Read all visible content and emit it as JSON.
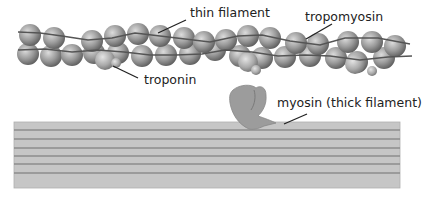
{
  "labels": {
    "thin_filament": "thin filament",
    "tropomyosin": "tropomyosin",
    "troponin": "troponin",
    "myosin": "myosin (thick filament)"
  },
  "colors": {
    "background": "#ffffff",
    "actin_light": "#d8d8d8",
    "actin_mid": "#9a9a9a",
    "actin_dark": "#5e5e5e",
    "tropomyosin_strand": "#555555",
    "thick_filament_fill": "#c4c4c4",
    "thick_filament_lines": "#8c8c8c",
    "myosin_head": "#9c9c9c",
    "leader_line": "#222222",
    "text": "#222222"
  },
  "diagram": {
    "thin_filament": {
      "top_row_beads_x": [
        38,
        62,
        88,
        113,
        138,
        163,
        188,
        213,
        238,
        262,
        288,
        313,
        338,
        363,
        388
      ],
      "top_row_y": [
        33,
        36,
        40,
        40,
        37,
        36,
        38,
        42,
        39,
        36,
        38,
        42,
        40,
        38,
        42
      ],
      "bottom_row_beads_x": [
        30,
        52,
        72,
        98,
        120,
        146,
        170,
        196,
        222,
        248,
        272,
        298,
        324,
        350,
        374,
        398
      ],
      "bottom_row_y": [
        52,
        55,
        55,
        53,
        50,
        53,
        55,
        55,
        50,
        52,
        55,
        55,
        53,
        58,
        60,
        57
      ],
      "troponin_positions": [
        [
          104,
          60
        ],
        [
          258,
          64
        ],
        [
          370,
          66
        ]
      ]
    },
    "thick_filament": {
      "x": 14,
      "y": 122,
      "width": 386,
      "height": 66,
      "line_y": [
        128,
        138,
        148,
        158,
        168,
        178
      ]
    }
  }
}
